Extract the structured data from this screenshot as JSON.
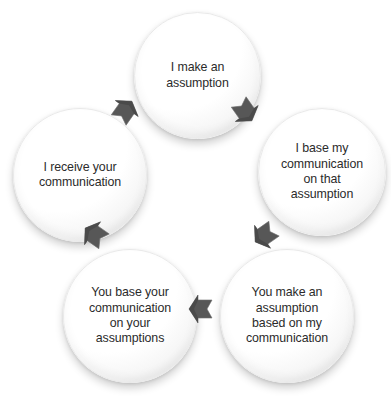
{
  "diagram": {
    "background_color": "#ffffff",
    "node_text_color": "#2b2b2b",
    "arrow_color": "#575757",
    "flow_direction": "counter-clockwise",
    "nodes": [
      {
        "id": "top",
        "label": "I make an\nassumption",
        "position": "top"
      },
      {
        "id": "right",
        "label": "I base my\ncommunication\non that\nassumption",
        "position": "right"
      },
      {
        "id": "bottomright",
        "label": "You make an\nassumption\nbased on my\ncommunication",
        "position": "bottom-right"
      },
      {
        "id": "bottomleft",
        "label": "You base your\ncommunication\non your\nassumptions",
        "position": "bottom-left"
      },
      {
        "id": "left",
        "label": "I receive your\ncommunication",
        "position": "left"
      }
    ],
    "arrows": [
      {
        "id": "top-to-right",
        "from": "top",
        "to": "right",
        "direction": "down-right"
      },
      {
        "id": "right-to-br",
        "from": "right",
        "to": "bottomright",
        "direction": "down-left"
      },
      {
        "id": "br-to-bl",
        "from": "bottomright",
        "to": "bottomleft",
        "direction": "left"
      },
      {
        "id": "bl-to-left",
        "from": "bottomleft",
        "to": "left",
        "direction": "up-left"
      },
      {
        "id": "left-to-top",
        "from": "left",
        "to": "top",
        "direction": "up-right"
      }
    ]
  }
}
